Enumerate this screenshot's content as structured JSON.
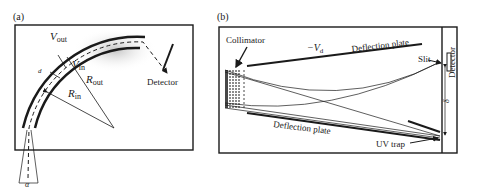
{
  "panel_a": {
    "label": "(a)",
    "v_out": "V",
    "v_out_sub": "out",
    "v_in": "V",
    "v_in_sub": "in",
    "r_out": "R",
    "r_out_sub": "out",
    "r_in": "R",
    "r_in_sub": "in",
    "d": "d",
    "alpha": "α",
    "detector": "Detector"
  },
  "panel_b": {
    "label": "(b)",
    "collimator": "Collimator",
    "vd": "−V",
    "vd_sub": "d",
    "deflection_plate_top": "Deflection plate",
    "deflection_plate_bottom": "Deflection plate",
    "slit": "Slit",
    "detector": "Detector",
    "delta": "δ",
    "uv_trap": "UV trap"
  },
  "colors": {
    "ink": "#1a1a1a",
    "background": "#ffffff",
    "shading": "#cfcfcf"
  }
}
